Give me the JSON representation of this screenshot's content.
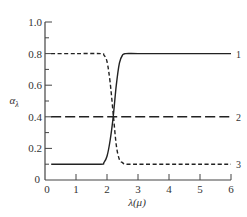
{
  "chart_data": {
    "type": "line",
    "title": "",
    "xlabel": "λ(μ)",
    "ylabel": "α_λ",
    "xlim": [
      0,
      6
    ],
    "ylim": [
      0,
      1.0
    ],
    "grid": false,
    "legend": "inline curve numbers at right end",
    "x_ticks": [
      "0",
      "1",
      "2",
      "3",
      "4",
      "5",
      "6"
    ],
    "y_ticks": [
      "0",
      "0.2",
      "0.4",
      "0.6",
      "0.8",
      "1.0"
    ],
    "series": [
      {
        "name": "1",
        "style": "solid",
        "x": [
          0.2,
          1.0,
          1.8,
          1.9,
          2.0,
          2.1,
          2.2,
          2.3,
          2.4,
          2.5,
          2.6,
          3.0,
          4.0,
          5.0,
          6.0
        ],
        "y": [
          0.1,
          0.1,
          0.1,
          0.11,
          0.15,
          0.25,
          0.4,
          0.6,
          0.74,
          0.79,
          0.8,
          0.8,
          0.8,
          0.8,
          0.8
        ]
      },
      {
        "name": "2",
        "style": "long-dash",
        "x": [
          0.2,
          1.0,
          2.0,
          3.0,
          4.0,
          5.0,
          6.0
        ],
        "y": [
          0.4,
          0.4,
          0.4,
          0.4,
          0.4,
          0.4,
          0.4
        ]
      },
      {
        "name": "3",
        "style": "short-dash",
        "x": [
          0.2,
          1.0,
          1.8,
          1.9,
          2.0,
          2.1,
          2.2,
          2.3,
          2.4,
          2.5,
          2.6,
          3.0,
          4.0,
          5.0,
          6.0
        ],
        "y": [
          0.8,
          0.8,
          0.8,
          0.79,
          0.75,
          0.62,
          0.42,
          0.22,
          0.13,
          0.11,
          0.1,
          0.1,
          0.1,
          0.1,
          0.1
        ]
      }
    ]
  },
  "labels": {
    "xlabel": "λ(μ)",
    "ylabel_main": "α",
    "ylabel_sub": "λ",
    "origin": "0"
  }
}
